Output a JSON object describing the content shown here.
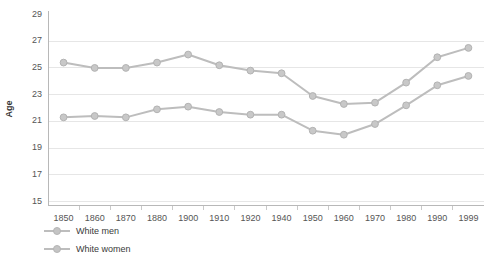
{
  "chart_data": {
    "type": "line",
    "title": "",
    "xlabel": "",
    "ylabel": "Age",
    "ylim": [
      15,
      29
    ],
    "yticks": [
      15,
      17,
      19,
      21,
      23,
      25,
      27,
      29
    ],
    "grid": true,
    "legend_position": "bottom-left",
    "categories": [
      "1850",
      "1860",
      "1870",
      "1880",
      "1900",
      "1910",
      "1920",
      "1940",
      "1950",
      "1960",
      "1970",
      "1980",
      "1990",
      "1999"
    ],
    "series": [
      {
        "name": "White men",
        "color": "#bdbdbd",
        "values": [
          25.4,
          25.0,
          25.0,
          25.4,
          26.0,
          25.2,
          24.8,
          24.6,
          22.9,
          22.3,
          22.4,
          23.9,
          25.8,
          26.5
        ]
      },
      {
        "name": "White women",
        "color": "#bdbdbd",
        "values": [
          21.3,
          21.4,
          21.3,
          21.9,
          22.1,
          21.7,
          21.5,
          21.5,
          20.3,
          20.0,
          20.8,
          22.2,
          23.7,
          24.4
        ]
      }
    ]
  },
  "axis": {
    "y_title": "Age"
  },
  "legend": {
    "items": [
      {
        "label": "White men"
      },
      {
        "label": "White women"
      }
    ]
  }
}
